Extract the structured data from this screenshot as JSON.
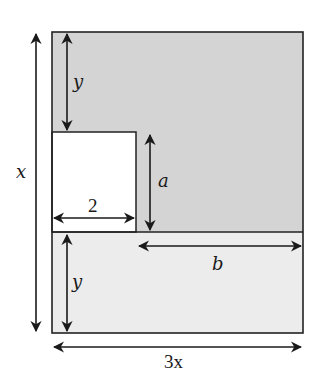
{
  "diagram": {
    "colors": {
      "dark_region": "#d4d4d4",
      "light_region": "#ececec",
      "cutout": "#ffffff",
      "stroke": "#222222"
    },
    "labels": {
      "height_total": "x",
      "top_gap": "y",
      "cutout_height": "a",
      "cutout_width": "2",
      "right_width": "b",
      "bottom_strip": "y",
      "total_width": "3x"
    }
  }
}
